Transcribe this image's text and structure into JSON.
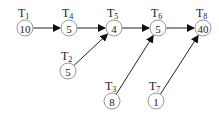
{
  "diagram": {
    "type": "task-precedence-graph",
    "nodes": [
      {
        "id": "T1",
        "name": "T",
        "sub": "1",
        "value": "10",
        "x": 25,
        "y": 28
      },
      {
        "id": "T4",
        "name": "T",
        "sub": "4",
        "value": "5",
        "x": 69,
        "y": 28
      },
      {
        "id": "T5",
        "name": "T",
        "sub": "5",
        "value": "4",
        "x": 114,
        "y": 28
      },
      {
        "id": "T6",
        "name": "T",
        "sub": "6",
        "value": "5",
        "x": 158,
        "y": 28
      },
      {
        "id": "T8",
        "name": "T",
        "sub": "8",
        "value": "40",
        "x": 203,
        "y": 28
      },
      {
        "id": "T2",
        "name": "T",
        "sub": "2",
        "value": "5",
        "x": 68,
        "y": 71
      },
      {
        "id": "T3",
        "name": "T",
        "sub": "3",
        "value": "8",
        "x": 112,
        "y": 101
      },
      {
        "id": "T7",
        "name": "T",
        "sub": "7",
        "value": "1",
        "x": 156,
        "y": 101
      }
    ],
    "edges": [
      {
        "from": "T1",
        "to": "T4"
      },
      {
        "from": "T4",
        "to": "T5"
      },
      {
        "from": "T5",
        "to": "T6"
      },
      {
        "from": "T6",
        "to": "T8"
      },
      {
        "from": "T2",
        "to": "T5"
      },
      {
        "from": "T3",
        "to": "T6"
      },
      {
        "from": "T7",
        "to": "T8"
      }
    ]
  }
}
